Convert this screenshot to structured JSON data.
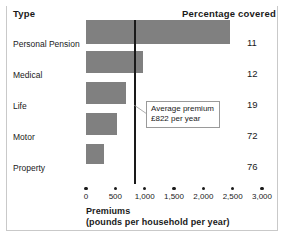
{
  "header": {
    "type_label": "Type",
    "percentage_label": "Percentage covered"
  },
  "annotation": {
    "line1": "Average premium",
    "line2": "£822 per year",
    "value": 822
  },
  "axis": {
    "title_line1": "Premiums",
    "title_line2": "(pounds per household per year)",
    "ticks": [
      "0",
      "500",
      "1,000",
      "1,500",
      "2,000",
      "2,500",
      "3,000"
    ]
  },
  "rows": [
    {
      "label": "Personal Pension",
      "premium": 2460,
      "percent": "11"
    },
    {
      "label": "Medical",
      "premium": 980,
      "percent": "12"
    },
    {
      "label": "Life",
      "premium": 680,
      "percent": "19"
    },
    {
      "label": "Motor",
      "premium": 530,
      "percent": "72"
    },
    {
      "label": "Property",
      "premium": 310,
      "percent": "76"
    }
  ],
  "colors": {
    "bar_fill": "#808080",
    "line": "#1a1a1a",
    "text": "#1a1a1a",
    "frame": "#c9c9c9",
    "background": "#ffffff"
  },
  "chart_data": {
    "type": "bar",
    "orientation": "horizontal",
    "title": "",
    "categories": [
      "Personal Pension",
      "Medical",
      "Life",
      "Motor",
      "Property"
    ],
    "values": [
      2460,
      980,
      680,
      530,
      310
    ],
    "series": [
      {
        "name": "Premiums (pounds per household per year)",
        "values": [
          2460,
          980,
          680,
          530,
          310
        ]
      },
      {
        "name": "Percentage covered",
        "values": [
          11,
          12,
          19,
          72,
          76
        ]
      }
    ],
    "xlabel": "Premiums (pounds per household per year)",
    "ylabel": "Type",
    "xlim": [
      0,
      3000
    ],
    "xticks": [
      0,
      500,
      1000,
      1500,
      2000,
      2500,
      3000
    ],
    "xticklabels": [
      "0",
      "500",
      "1,000",
      "1,500",
      "2,000",
      "2,500",
      "3,000"
    ],
    "grid": false,
    "legend": null,
    "annotations": [
      {
        "text": "Average premium £822 per year",
        "type": "vertical-reference-line",
        "value": 822
      }
    ]
  }
}
